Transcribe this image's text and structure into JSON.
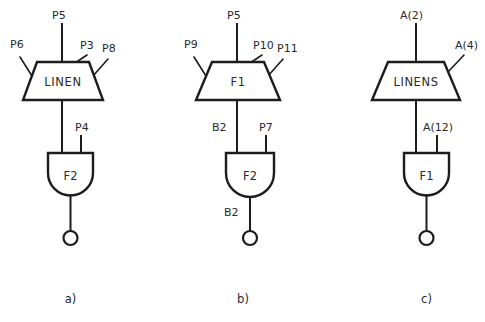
{
  "figure": {
    "background_color": "#ffffff",
    "line_color": "#1c1c1c",
    "panels": [
      {
        "caption": "a)",
        "block": {
          "name": "LINEN",
          "shape": "trapezoid",
          "top_pin": "P5",
          "top_right_pin": "P3",
          "left_pin": "P6",
          "right_pin": "P8"
        },
        "gate": {
          "name": "F2",
          "shape": "and-gate",
          "right_input": "P4",
          "output_label": "",
          "output_bubble": true
        }
      },
      {
        "caption": "b)",
        "block": {
          "name": "F1",
          "shape": "trapezoid",
          "top_pin": "P5",
          "top_right_pin": "P10",
          "left_pin": "P9",
          "right_pin": "P11"
        },
        "gate": {
          "name": "F2",
          "shape": "and-gate",
          "left_input": "B2",
          "right_input": "P7",
          "output_label": "B2",
          "output_bubble": true
        }
      },
      {
        "caption": "c)",
        "block": {
          "name": "LINENS",
          "shape": "trapezoid",
          "top_pin": "A(2)",
          "right_pin": "A(4)"
        },
        "gate": {
          "name": "F1",
          "shape": "and-gate",
          "right_input": "A(12)",
          "output_label": "",
          "output_bubble": true
        }
      }
    ]
  },
  "panel_a": {
    "caption": "a)",
    "block_name": "LINEN",
    "pin_top": "P5",
    "pin_top_right": "P3",
    "pin_left": "P6",
    "pin_right": "P8",
    "gate_name": "F2",
    "gate_right_input": "P4"
  },
  "panel_b": {
    "caption": "b)",
    "block_name": "F1",
    "pin_top": "P5",
    "pin_top_right": "P10",
    "pin_left": "P9",
    "pin_right": "P11",
    "gate_name": "F2",
    "gate_left_input": "B2",
    "gate_right_input": "P7",
    "gate_output": "B2"
  },
  "panel_c": {
    "caption": "c)",
    "block_name": "LINENS",
    "pin_top": "A(2)",
    "pin_right": "A(4)",
    "gate_name": "F1",
    "gate_right_input": "A(12)"
  }
}
